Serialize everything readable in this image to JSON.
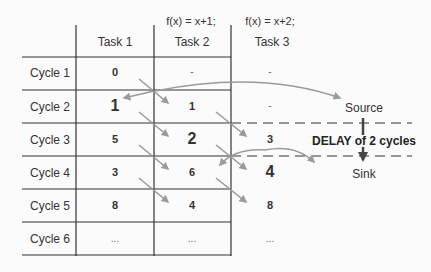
{
  "formulas": {
    "task2": "f(x) = x+1;",
    "task3": "f(x) = x+2;"
  },
  "columns": [
    "Task 1",
    "Task 2",
    "Task 3"
  ],
  "rows": [
    {
      "label": "Cycle 1",
      "cells": [
        "0",
        "-",
        "-"
      ]
    },
    {
      "label": "Cycle 2",
      "cells": [
        "1",
        "1",
        "-"
      ]
    },
    {
      "label": "Cycle 3",
      "cells": [
        "5",
        "2",
        "3"
      ]
    },
    {
      "label": "Cycle 4",
      "cells": [
        "3",
        "6",
        "4"
      ]
    },
    {
      "label": "Cycle 5",
      "cells": [
        "8",
        "4",
        "8"
      ]
    },
    {
      "label": "Cycle 6",
      "cells": [
        "...",
        "...",
        "..."
      ]
    }
  ],
  "annotations": {
    "source": "Source",
    "sink": "Sink",
    "delay": "DELAY of 2 cycles"
  },
  "colors": {
    "grid": "#333333",
    "arrow": "#999999",
    "delay_arrow": "#444444"
  }
}
